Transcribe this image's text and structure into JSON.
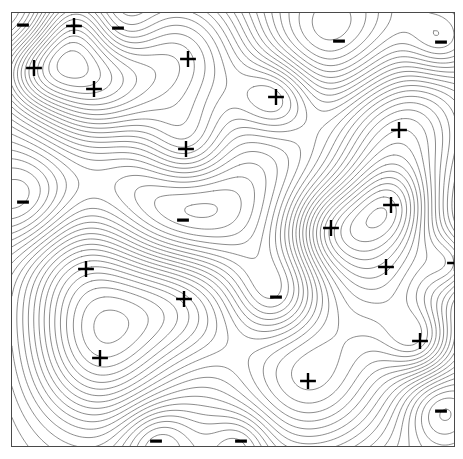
{
  "figure": {
    "type": "contour-map",
    "title": "",
    "background_color": "#ffffff",
    "frame": {
      "x": 11,
      "y": 12,
      "width": 444,
      "height": 435,
      "border_color": "#4a4a4a",
      "border_width": 1
    },
    "contour_line_color": "#5a5a5a",
    "contour_line_width": 0.7,
    "marker_color": "#000000"
  },
  "chart_data": {
    "type": "contour",
    "title": "",
    "xlabel": "",
    "ylabel": "",
    "xlim": [
      0,
      444
    ],
    "ylim": [
      0,
      435
    ],
    "grid": false,
    "legend": "none",
    "axis_ticks": "none",
    "contour_levels_count": 28,
    "contour_level_step": 1,
    "maxima_label": "+",
    "minima_label": "-",
    "maxima_count": 16,
    "minima_count": 10,
    "maxima": [
      {
        "label": "+",
        "x": 73,
        "y": 25,
        "strength": 9.5,
        "radius": 34
      },
      {
        "label": "+",
        "x": 33,
        "y": 67,
        "strength": 9.0,
        "radius": 30
      },
      {
        "label": "+",
        "x": 93,
        "y": 88,
        "strength": 13.0,
        "radius": 44
      },
      {
        "label": "+",
        "x": 187,
        "y": 58,
        "strength": 11.5,
        "radius": 52
      },
      {
        "label": "+",
        "x": 275,
        "y": 96,
        "strength": 9.0,
        "radius": 28
      },
      {
        "label": "+",
        "x": 398,
        "y": 129,
        "strength": 14.0,
        "radius": 56
      },
      {
        "label": "+",
        "x": 185,
        "y": 148,
        "strength": 8.5,
        "radius": 32
      },
      {
        "label": "+",
        "x": 390,
        "y": 204,
        "strength": 9.0,
        "radius": 30
      },
      {
        "label": "+",
        "x": 330,
        "y": 227,
        "strength": 9.5,
        "radius": 32
      },
      {
        "label": "+",
        "x": 385,
        "y": 266,
        "strength": 13.0,
        "radius": 50
      },
      {
        "label": "+",
        "x": 419,
        "y": 340,
        "strength": 8.5,
        "radius": 26
      },
      {
        "label": "+",
        "x": 85,
        "y": 268,
        "strength": 13.5,
        "radius": 56
      },
      {
        "label": "+",
        "x": 183,
        "y": 298,
        "strength": 12.0,
        "radius": 46
      },
      {
        "label": "+",
        "x": 99,
        "y": 357,
        "strength": 13.5,
        "radius": 54
      },
      {
        "label": "+",
        "x": 307,
        "y": 380,
        "strength": 14.5,
        "radius": 64
      },
      {
        "label": "+",
        "x": 454,
        "y": 262,
        "strength": 7.0,
        "radius": 22
      }
    ],
    "minima": [
      {
        "label": "-",
        "x": 22,
        "y": 24,
        "strength": -6.0,
        "radius": 30
      },
      {
        "label": "-",
        "x": 117,
        "y": 27,
        "strength": -5.0,
        "radius": 26
      },
      {
        "label": "-",
        "x": 338,
        "y": 40,
        "strength": -7.0,
        "radius": 52
      },
      {
        "label": "-",
        "x": 440,
        "y": 41,
        "strength": -5.5,
        "radius": 24
      },
      {
        "label": "-",
        "x": 22,
        "y": 201,
        "strength": -6.5,
        "radius": 36
      },
      {
        "label": "-",
        "x": 182,
        "y": 219,
        "strength": -7.5,
        "radius": 58
      },
      {
        "label": "-",
        "x": 275,
        "y": 296,
        "strength": -6.0,
        "radius": 30
      },
      {
        "label": "-",
        "x": 440,
        "y": 410,
        "strength": -5.5,
        "radius": 26
      },
      {
        "label": "-",
        "x": 155,
        "y": 440,
        "strength": -5.0,
        "radius": 26
      },
      {
        "label": "-",
        "x": 240,
        "y": 440,
        "strength": -4.0,
        "radius": 22
      }
    ]
  }
}
